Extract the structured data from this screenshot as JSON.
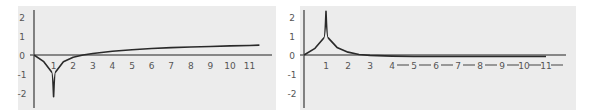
{
  "chart_data": [
    {
      "type": "line",
      "title": "",
      "xlabel": "",
      "ylabel": "",
      "xlim": [
        0,
        11.5
      ],
      "ylim": [
        -2.2,
        2.2
      ],
      "grid": false,
      "x_ticks": [
        "0",
        "1",
        "2",
        "3",
        "4",
        "5",
        "6",
        "7",
        "8",
        "9",
        "10",
        "11"
      ],
      "y_ticks": [
        "2",
        "1",
        "0",
        "-1",
        "-2"
      ],
      "description": "Curve starts at 0, dives to a sharp cusp at x=1 going to -infinity (clipped at -2), rises back crossing 0 near x=2.5, then increases slowly",
      "x": [
        0,
        0.5,
        0.9,
        1,
        1.1,
        1.5,
        2,
        2.5,
        3,
        4,
        5,
        6,
        7,
        8,
        9,
        10,
        11,
        11.5
      ],
      "y": [
        0,
        -0.35,
        -0.9,
        -2.2,
        -0.9,
        -0.35,
        -0.12,
        0,
        0.08,
        0.2,
        0.28,
        0.34,
        0.39,
        0.42,
        0.45,
        0.48,
        0.5,
        0.52
      ]
    },
    {
      "type": "line",
      "title": "",
      "xlabel": "",
      "ylabel": "",
      "xlim": [
        0,
        11.5
      ],
      "ylim": [
        -2.2,
        2.2
      ],
      "grid": false,
      "x_ticks": [
        "0",
        "1",
        "2",
        "3",
        "4",
        "5",
        "6",
        "7",
        "8",
        "9",
        "10",
        "11"
      ],
      "y_ticks": [
        "2",
        "1",
        "0",
        "-1",
        "-2"
      ],
      "description": "Curve starts at 0, rises to a sharp cusp at x=1 going to +infinity (clipped above 2), then decays toward 0 and slightly below, approaching the axis",
      "x": [
        0,
        0.5,
        0.9,
        1,
        1.1,
        1.5,
        2,
        2.5,
        3,
        4,
        5,
        6,
        7,
        8,
        9,
        10,
        11
      ],
      "y": [
        0,
        0.35,
        0.9,
        2.3,
        0.9,
        0.4,
        0.15,
        0.03,
        -0.02,
        -0.06,
        -0.08,
        -0.08,
        -0.08,
        -0.08,
        -0.08,
        -0.08,
        -0.08
      ]
    }
  ]
}
